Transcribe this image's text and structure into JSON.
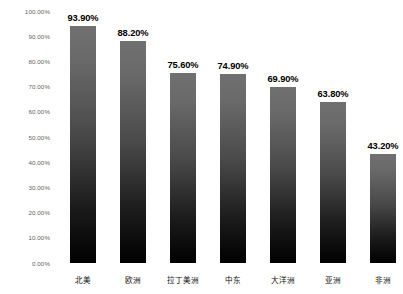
{
  "chart_data": {
    "type": "bar",
    "title": "",
    "subtitle": "",
    "xlabel": "",
    "ylabel": "",
    "ylim": [
      0,
      100
    ],
    "grid": false,
    "legend": false,
    "legend_position": "none",
    "value_suffix": "%",
    "bar_color_top": "#707070",
    "bar_color_bottom": "#000000",
    "background_color": "#ffffff",
    "tick_label_color": "#5f5f5f",
    "value_label_color": "#000000",
    "categories": [
      "北美",
      "欧洲",
      "拉丁美洲",
      "中东",
      "大洋洲",
      "亚洲",
      "非洲"
    ],
    "values": [
      93.9,
      88.2,
      75.6,
      74.9,
      69.9,
      63.8,
      43.2
    ],
    "value_labels": [
      "93.90%",
      "88.20%",
      "75.60%",
      "74.90%",
      "69.90%",
      "63.80%",
      "43.20%"
    ],
    "yticks": [
      0,
      10,
      20,
      30,
      40,
      50,
      60,
      70,
      80,
      90,
      100
    ],
    "ytick_labels": [
      "0.00%",
      "10.00%",
      "20.00%",
      "30.00%",
      "40.00%",
      "50.00%",
      "60.00%",
      "70.00%",
      "80.00%",
      "90.00%",
      "100.00%"
    ]
  }
}
